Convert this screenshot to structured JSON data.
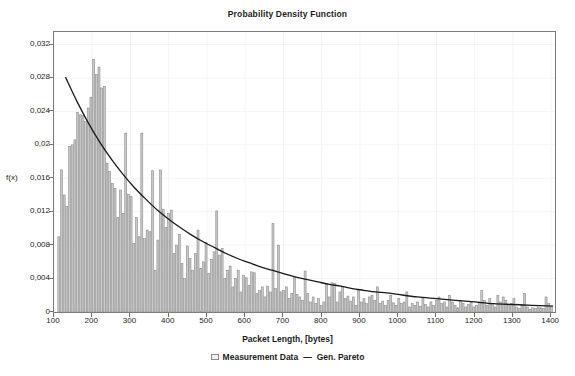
{
  "chart_data": {
    "type": "bar",
    "title": "Probability Density Function",
    "xlabel": "Packet Length, [bytes]",
    "ylabel": "f(x)",
    "xlim": [
      100,
      1410
    ],
    "ylim": [
      0,
      0.0335
    ],
    "grid": true,
    "legend_position": "bottom-center",
    "decimal_separator": ",",
    "x_ticks": [
      100,
      200,
      300,
      400,
      500,
      600,
      700,
      800,
      900,
      1000,
      1100,
      1200,
      1300,
      1400
    ],
    "x_tick_labels": [
      "100",
      "200",
      "300",
      "400",
      "500",
      "600",
      "700",
      "800",
      "900",
      "1000",
      "1100",
      "1200",
      "1300",
      "1400"
    ],
    "y_ticks": [
      0,
      0.004,
      0.008,
      0.012,
      0.016,
      0.02,
      0.024,
      0.028,
      0.032
    ],
    "y_tick_labels": [
      "0",
      "0,004",
      "0,008",
      "0,012",
      "0,016",
      "0,02",
      "0,024",
      "0,028",
      "0,032"
    ],
    "series": [
      {
        "name": "Measurement Data",
        "type": "histogram",
        "color": "#c9c9c9",
        "edge_color": "#8d8d8d",
        "bin_width": 7,
        "bin_starts": [
          110,
          117,
          124,
          131,
          138,
          145,
          152,
          159,
          166,
          173,
          180,
          187,
          194,
          201,
          208,
          215,
          222,
          229,
          236,
          243,
          250,
          257,
          264,
          271,
          278,
          285,
          292,
          299,
          306,
          313,
          320,
          327,
          334,
          341,
          348,
          355,
          362,
          369,
          376,
          383,
          390,
          397,
          404,
          411,
          418,
          425,
          432,
          439,
          446,
          453,
          460,
          467,
          474,
          481,
          488,
          495,
          502,
          509,
          516,
          523,
          530,
          537,
          544,
          551,
          558,
          565,
          572,
          579,
          586,
          593,
          600,
          607,
          614,
          621,
          628,
          635,
          642,
          649,
          656,
          663,
          670,
          677,
          684,
          691,
          698,
          705,
          712,
          719,
          726,
          733,
          740,
          747,
          754,
          761,
          768,
          775,
          782,
          789,
          796,
          803,
          810,
          817,
          824,
          831,
          838,
          845,
          852,
          859,
          866,
          873,
          880,
          887,
          894,
          901,
          908,
          915,
          922,
          929,
          936,
          943,
          950,
          957,
          964,
          971,
          978,
          985,
          992,
          999,
          1006,
          1013,
          1020,
          1027,
          1034,
          1041,
          1048,
          1055,
          1062,
          1069,
          1076,
          1083,
          1090,
          1097,
          1104,
          1111,
          1118,
          1125,
          1132,
          1139,
          1146,
          1153,
          1160,
          1167,
          1174,
          1181,
          1188,
          1195,
          1202,
          1209,
          1216,
          1223,
          1230,
          1237,
          1244,
          1251,
          1258,
          1265,
          1272,
          1279,
          1286,
          1293,
          1300,
          1307,
          1314,
          1321,
          1328,
          1335,
          1342,
          1349,
          1356,
          1363,
          1370,
          1377,
          1384,
          1391,
          1398
        ],
        "values": [
          0.009,
          0.017,
          0.014,
          0.0126,
          0.0198,
          0.02,
          0.0206,
          0.0239,
          0.0236,
          0.0235,
          0.0228,
          0.0244,
          0.0257,
          0.0302,
          0.0284,
          0.0293,
          0.0268,
          0.027,
          0.0178,
          0.0168,
          0.0154,
          0.0148,
          0.0113,
          0.0146,
          0.0118,
          0.0214,
          0.0141,
          0.0138,
          0.0082,
          0.0113,
          0.009,
          0.0214,
          0.0088,
          0.0098,
          0.0096,
          0.0169,
          0.005,
          0.0086,
          0.017,
          0.0123,
          0.0101,
          0.0118,
          0.0122,
          0.007,
          0.008,
          0.0093,
          0.0058,
          0.004,
          0.0079,
          0.0064,
          0.005,
          0.007,
          0.0098,
          0.0052,
          0.006,
          0.0083,
          0.0046,
          0.0063,
          0.0072,
          0.0121,
          0.0068,
          0.0076,
          0.004,
          0.005,
          0.0055,
          0.003,
          0.004,
          0.005,
          0.0024,
          0.0044,
          0.0041,
          0.0032,
          0.0048,
          0.0047,
          0.0022,
          0.0026,
          0.003,
          0.0018,
          0.0031,
          0.0024,
          0.0106,
          0.0028,
          0.008,
          0.0024,
          0.0026,
          0.003,
          0.0016,
          0.0022,
          0.0042,
          0.0021,
          0.0018,
          0.0014,
          0.0049,
          0.0022,
          0.0012,
          0.0018,
          0.001,
          0.0016,
          0.0008,
          0.0012,
          0.0034,
          0.0018,
          0.0035,
          0.0034,
          0.0012,
          0.0024,
          0.003,
          0.0016,
          0.0019,
          0.0013,
          0.0018,
          0.0008,
          0.0026,
          0.0012,
          0.0016,
          0.001,
          0.0018,
          0.002,
          0.0014,
          0.003,
          0.001,
          0.0013,
          0.0008,
          0.0014,
          0.002,
          0.0011,
          0.0008,
          0.0016,
          0.001,
          0.0012,
          0.0024,
          0.0006,
          0.001,
          0.0008,
          0.0012,
          0.0007,
          0.0016,
          0.0009,
          0.0006,
          0.0012,
          0.0008,
          0.0014,
          0.0018,
          0.001,
          0.0012,
          0.0006,
          0.002,
          0.0012,
          0.0008,
          0.0005,
          0.0014,
          0.001,
          0.0006,
          0.0009,
          0.0012,
          0.0006,
          0.0008,
          0.0012,
          0.0026,
          0.0014,
          0.0008,
          0.0016,
          0.001,
          0.0006,
          0.002,
          0.0012,
          0.0018,
          0.0014,
          0.0008,
          0.001,
          0.0016,
          0.0006,
          0.0004,
          0.0008,
          0.0022,
          0.0006,
          0.0003,
          0.0005,
          0.0004,
          0.0006,
          0.0005,
          0.0004,
          0.0018,
          0.001,
          0.0006,
          0.0012
        ]
      },
      {
        "name": "Gen. Pareto",
        "type": "line",
        "color": "#1a1a1a",
        "x_start": 130,
        "x_end": 1405,
        "y_start": 0.0281,
        "points_x": [
          130,
          160,
          190,
          220,
          250,
          280,
          310,
          340,
          370,
          400,
          430,
          460,
          490,
          520,
          550,
          580,
          610,
          640,
          670,
          700,
          730,
          760,
          790,
          820,
          850,
          880,
          910,
          940,
          970,
          1000,
          1050,
          1100,
          1150,
          1200,
          1250,
          1300,
          1350,
          1405
        ],
        "points_y": [
          0.0281,
          0.0252,
          0.0226,
          0.0203,
          0.0183,
          0.0165,
          0.0149,
          0.0135,
          0.0122,
          0.0111,
          0.0101,
          0.0092,
          0.0084,
          0.0077,
          0.007,
          0.0064,
          0.0059,
          0.0054,
          0.005,
          0.0046,
          0.0042,
          0.0039,
          0.0036,
          0.0033,
          0.0031,
          0.0028,
          0.0026,
          0.0024,
          0.0023,
          0.0021,
          0.0018,
          0.0016,
          0.0014,
          0.0012,
          0.001,
          0.0009,
          0.0008,
          0.0007
        ]
      }
    ]
  },
  "legend": {
    "measurement_label": "Measurement Data",
    "separator": "—",
    "model_label": "Gen. Pareto"
  },
  "colors": {
    "bar_fill": "#c9c9c9",
    "bar_edge": "#8d8d8d",
    "curve": "#1a1a1a",
    "frame": "#7c7c7c",
    "grid": "#f4f4f4",
    "text": "#1c1c1c"
  }
}
